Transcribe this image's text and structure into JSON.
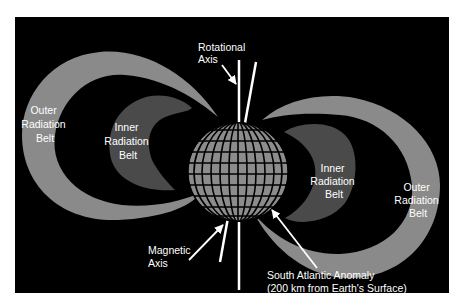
{
  "diagram": {
    "colors": {
      "background": "#000000",
      "outer_belt": "#8a8a8a",
      "inner_belt": "#4a4a4a",
      "globe_fill": "#8c8c8c",
      "globe_grid": "#000000",
      "axis_lines": "#ffffff",
      "label_text": "#ffffff",
      "page": "#ffffff"
    },
    "labels": {
      "rotational_axis": [
        "Rotational",
        "Axis"
      ],
      "magnetic_axis": [
        "Magnetic",
        "Axis"
      ],
      "outer_belt_left": [
        "Outer",
        "Radiation",
        "Belt"
      ],
      "inner_belt_left": [
        "Inner",
        "Radiation",
        "Belt"
      ],
      "inner_belt_right": [
        "Inner",
        "Radiation",
        "Belt"
      ],
      "outer_belt_right": [
        "Outer",
        "Radiation",
        "Belt"
      ],
      "south_atlantic_anomaly": [
        "South Atlantic Anomaly",
        "(200 km from Earth's Surface)"
      ]
    },
    "elements": [
      {
        "name": "earth-globe",
        "type": "globe"
      },
      {
        "name": "rotational-axis",
        "type": "line"
      },
      {
        "name": "magnetic-axis",
        "type": "line"
      },
      {
        "name": "outer-radiation-belt-left",
        "type": "belt"
      },
      {
        "name": "inner-radiation-belt-left",
        "type": "belt"
      },
      {
        "name": "inner-radiation-belt-right",
        "type": "belt"
      },
      {
        "name": "outer-radiation-belt-right",
        "type": "belt"
      }
    ]
  }
}
